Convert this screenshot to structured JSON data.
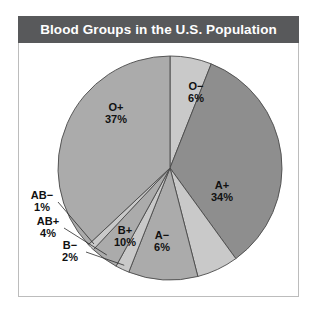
{
  "figure": {
    "title": "Blood Groups in the U.S. Population",
    "title_bar_color": "#58595B",
    "title_text_color": "#FFFFFF",
    "frame_border_color": "#BCBCBC",
    "background": "#FFFFFF"
  },
  "chart_data": {
    "type": "pie",
    "title": "Blood Groups in the U.S. Population",
    "xlabel": "",
    "ylabel": "",
    "legend": "none",
    "grid": false,
    "start_angle_deg": 0,
    "direction": "clockwise",
    "categories": [
      "O−",
      "A+",
      "A−",
      "B+",
      "B−",
      "AB+",
      "AB−",
      "O+"
    ],
    "values": [
      6,
      34,
      6,
      10,
      2,
      4,
      1,
      37
    ],
    "value_unit": "%",
    "slices": [
      {
        "label": "O−",
        "value": 6,
        "percent_text": "6%",
        "color": "#C9C9C9",
        "label_x": 196,
        "label_y": 87,
        "pct_x": 196,
        "pct_y": 99,
        "leader": false
      },
      {
        "label": "A+",
        "value": 34,
        "percent_text": "34%",
        "color": "#8E8E8E",
        "label_x": 222,
        "label_y": 186,
        "pct_x": 222,
        "pct_y": 198,
        "leader": false
      },
      {
        "label": "A−",
        "value": 6,
        "percent_text": "6%",
        "color": "#C9C9C9",
        "label_x": 162,
        "label_y": 236,
        "pct_x": 162,
        "pct_y": 248,
        "leader": false
      },
      {
        "label": "B+",
        "value": 10,
        "percent_text": "10%",
        "color": "#ABABAB",
        "label_x": 125,
        "label_y": 231,
        "pct_x": 125,
        "pct_y": 243,
        "leader": false
      },
      {
        "label": "B−",
        "value": 2,
        "percent_text": "2%",
        "color": "#C9C9C9",
        "label_x": 70,
        "label_y": 246,
        "pct_x": 70,
        "pct_y": 258,
        "leader": true
      },
      {
        "label": "AB+",
        "value": 4,
        "percent_text": "4%",
        "color": "#ABABAB",
        "label_x": 48,
        "label_y": 222,
        "pct_x": 48,
        "pct_y": 234,
        "leader": true
      },
      {
        "label": "AB−",
        "value": 1,
        "percent_text": "1%",
        "color": "#C9C9C9",
        "label_x": 42,
        "label_y": 196,
        "pct_x": 42,
        "pct_y": 208,
        "leader": true
      },
      {
        "label": "O+",
        "value": 37,
        "percent_text": "37%",
        "color": "#ABABAB",
        "label_x": 116,
        "label_y": 108,
        "pct_x": 116,
        "pct_y": 120,
        "leader": false
      }
    ],
    "center_x": 170,
    "center_y": 168,
    "radius": 112,
    "outline_color": "#4A4A4A"
  }
}
